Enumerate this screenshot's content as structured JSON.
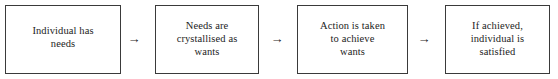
{
  "diagram": {
    "type": "flowchart",
    "orientation": "horizontal",
    "title": "",
    "style": {
      "box_border_color": "#3a3a3a",
      "box_fill_color": "#ffffff",
      "text_color": "#1c1c1c",
      "arrow_color": "#2a2a2a",
      "background_color": "#ffffff"
    },
    "nodes": [
      {
        "id": "node-1",
        "lines": [
          "Individual has",
          "needs"
        ],
        "text": "Individual has needs",
        "x": 5,
        "y": 5,
        "width": 116,
        "height": 69,
        "pad_top": 18
      },
      {
        "id": "node-2",
        "lines": [
          "Needs are",
          "crystallised as",
          "wants"
        ],
        "text": "Needs are crystallised as wants",
        "x": 155,
        "y": 5,
        "width": 104,
        "height": 69,
        "pad_top": 13
      },
      {
        "id": "node-3",
        "lines": [
          "Action is taken",
          "to achieve",
          "wants"
        ],
        "text": "Action is taken to achieve wants",
        "x": 297,
        "y": 5,
        "width": 111,
        "height": 69,
        "pad_top": 13
      },
      {
        "id": "node-4",
        "lines": [
          "If achieved,",
          "individual is",
          "satisfied"
        ],
        "text": "If achieved, individual is satisfied",
        "x": 445,
        "y": 5,
        "width": 105,
        "height": 69,
        "pad_top": 13
      }
    ],
    "connectors": [
      {
        "id": "arrow-1",
        "glyph": "→",
        "icon": "arrow-right-icon",
        "from": "node-1",
        "to": "node-2",
        "x": 127,
        "y": 32
      },
      {
        "id": "arrow-2",
        "glyph": "→",
        "icon": "arrow-right-icon",
        "from": "node-2",
        "to": "node-3",
        "x": 270,
        "y": 32
      },
      {
        "id": "arrow-3",
        "glyph": "→",
        "icon": "arrow-right-icon",
        "from": "node-3",
        "to": "node-4",
        "x": 417,
        "y": 32
      }
    ]
  }
}
